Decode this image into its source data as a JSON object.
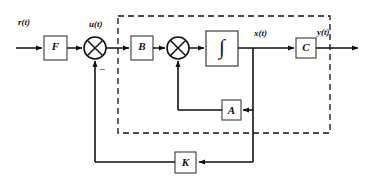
{
  "diagram": {
    "stroke_color": "#111111",
    "box_fill": "#ffffff",
    "dashed_color": "#111111",
    "signals": {
      "reference": "r(t)",
      "control": "u(t)",
      "state": "x(t)",
      "output": "y(t)"
    },
    "summing_junctions": [
      {
        "name": "input-sum",
        "sign": "−"
      },
      {
        "name": "state-sum",
        "sign": ""
      }
    ],
    "blocks": [
      {
        "id": "F",
        "label": "F",
        "name": "block-f"
      },
      {
        "id": "B",
        "label": "B",
        "name": "block-b"
      },
      {
        "id": "INT",
        "label": "∫",
        "name": "block-integrator"
      },
      {
        "id": "C",
        "label": "C",
        "name": "block-c"
      },
      {
        "id": "A",
        "label": "A",
        "name": "block-a"
      },
      {
        "id": "K",
        "label": "K",
        "name": "block-k"
      }
    ],
    "plant_boundary": {
      "name": "plant-dashed-boundary",
      "style": "dashed"
    }
  }
}
